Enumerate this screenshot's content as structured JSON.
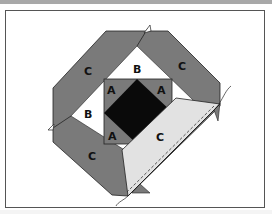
{
  "figure": {
    "colors": {
      "dark_gray": "#7a7a7a",
      "center_black": "#0a0a0a",
      "light_gray": "#e2e2e2",
      "white": "#ffffff",
      "outline": "#222222",
      "frame_border": "#555555",
      "top_bar": "#a8a8a8"
    },
    "labels": {
      "c_top_left": "C",
      "c_top_right": "C",
      "b_top": "B",
      "a_top_left": "A",
      "a_top_right": "A",
      "b_left": "B",
      "a_bottom_left": "A",
      "c_folded": "C",
      "c_bottom_left": "C"
    }
  }
}
